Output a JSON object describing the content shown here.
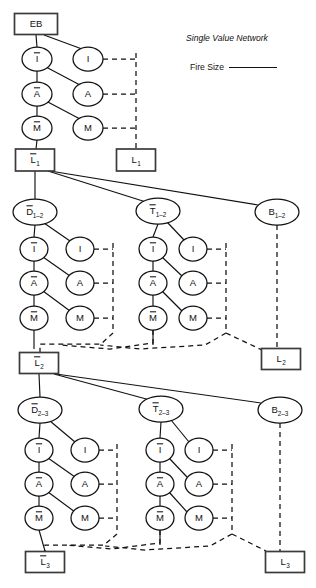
{
  "figure": {
    "type": "influence-diagram",
    "background": "#ffffff",
    "line_color": "#111111",
    "box_stroke": "#3b3b3b"
  },
  "legend": {
    "title": "Single Value Network",
    "entries": [
      {
        "label": "Fire Size",
        "style": "solid-line"
      }
    ]
  },
  "nodes": [
    {
      "id": "EB",
      "label": "EB",
      "shape": "rect",
      "overbar": false,
      "sub": "",
      "cx": 36,
      "cy": 24,
      "w": 43,
      "h": 21
    },
    {
      "id": "I0b",
      "label": "I",
      "shape": "ellipse",
      "overbar": true,
      "sub": "",
      "cx": 37,
      "cy": 59,
      "rx": 15,
      "ry": 12
    },
    {
      "id": "I0",
      "label": "I",
      "shape": "ellipse",
      "overbar": false,
      "sub": "",
      "cx": 88,
      "cy": 59,
      "rx": 15,
      "ry": 12
    },
    {
      "id": "A0b",
      "label": "A",
      "shape": "ellipse",
      "overbar": true,
      "sub": "",
      "cx": 37,
      "cy": 94,
      "rx": 15,
      "ry": 12
    },
    {
      "id": "A0",
      "label": "A",
      "shape": "ellipse",
      "overbar": false,
      "sub": "",
      "cx": 88,
      "cy": 94,
      "rx": 15,
      "ry": 12
    },
    {
      "id": "M0b",
      "label": "M",
      "shape": "ellipse",
      "overbar": true,
      "sub": "",
      "cx": 37,
      "cy": 128,
      "rx": 15,
      "ry": 12
    },
    {
      "id": "M0",
      "label": "M",
      "shape": "ellipse",
      "overbar": false,
      "sub": "",
      "cx": 88,
      "cy": 128,
      "rx": 15,
      "ry": 12
    },
    {
      "id": "L1b",
      "label": "L",
      "shape": "rect",
      "overbar": true,
      "sub": "1",
      "cx": 35,
      "cy": 160,
      "w": 39,
      "h": 22
    },
    {
      "id": "L1",
      "label": "L",
      "shape": "rect",
      "overbar": false,
      "sub": "1",
      "cx": 136,
      "cy": 160,
      "w": 39,
      "h": 22
    },
    {
      "id": "D12",
      "label": "D",
      "shape": "ellipse",
      "overbar": true,
      "sub": "1–2",
      "cx": 35,
      "cy": 212,
      "rx": 22,
      "ry": 13
    },
    {
      "id": "T12",
      "label": "T",
      "shape": "ellipse",
      "overbar": true,
      "sub": "1–2",
      "cx": 158,
      "cy": 211,
      "rx": 22,
      "ry": 13
    },
    {
      "id": "B12",
      "label": "B",
      "shape": "ellipse",
      "overbar": false,
      "sub": "1–2",
      "cx": 277,
      "cy": 212,
      "rx": 22,
      "ry": 13
    },
    {
      "id": "I1Lb",
      "label": "I",
      "shape": "ellipse",
      "overbar": true,
      "sub": "",
      "cx": 34,
      "cy": 249,
      "rx": 14,
      "ry": 12
    },
    {
      "id": "I1L",
      "label": "I",
      "shape": "ellipse",
      "overbar": false,
      "sub": "",
      "cx": 80,
      "cy": 249,
      "rx": 14,
      "ry": 12
    },
    {
      "id": "A1Lb",
      "label": "A",
      "shape": "ellipse",
      "overbar": true,
      "sub": "",
      "cx": 34,
      "cy": 283,
      "rx": 14,
      "ry": 12
    },
    {
      "id": "A1L",
      "label": "A",
      "shape": "ellipse",
      "overbar": false,
      "sub": "",
      "cx": 80,
      "cy": 283,
      "rx": 14,
      "ry": 12
    },
    {
      "id": "M1Lb",
      "label": "M",
      "shape": "ellipse",
      "overbar": true,
      "sub": "",
      "cx": 34,
      "cy": 318,
      "rx": 14,
      "ry": 12
    },
    {
      "id": "M1L",
      "label": "M",
      "shape": "ellipse",
      "overbar": false,
      "sub": "",
      "cx": 80,
      "cy": 318,
      "rx": 14,
      "ry": 12
    },
    {
      "id": "I1Rb",
      "label": "I",
      "shape": "ellipse",
      "overbar": true,
      "sub": "",
      "cx": 153,
      "cy": 249,
      "rx": 14,
      "ry": 12
    },
    {
      "id": "I1R",
      "label": "I",
      "shape": "ellipse",
      "overbar": false,
      "sub": "",
      "cx": 193,
      "cy": 249,
      "rx": 14,
      "ry": 12
    },
    {
      "id": "A1Rb",
      "label": "A",
      "shape": "ellipse",
      "overbar": true,
      "sub": "",
      "cx": 153,
      "cy": 283,
      "rx": 14,
      "ry": 12
    },
    {
      "id": "A1R",
      "label": "A",
      "shape": "ellipse",
      "overbar": false,
      "sub": "",
      "cx": 193,
      "cy": 283,
      "rx": 14,
      "ry": 12
    },
    {
      "id": "M1Rb",
      "label": "M",
      "shape": "ellipse",
      "overbar": true,
      "sub": "",
      "cx": 153,
      "cy": 318,
      "rx": 14,
      "ry": 12
    },
    {
      "id": "M1R",
      "label": "M",
      "shape": "ellipse",
      "overbar": false,
      "sub": "",
      "cx": 193,
      "cy": 318,
      "rx": 14,
      "ry": 12
    },
    {
      "id": "L2b",
      "label": "L",
      "shape": "rect",
      "overbar": true,
      "sub": "2",
      "cx": 39,
      "cy": 363,
      "w": 39,
      "h": 21
    },
    {
      "id": "L2",
      "label": "L",
      "shape": "rect",
      "overbar": false,
      "sub": "2",
      "cx": 281,
      "cy": 359,
      "w": 39,
      "h": 21
    },
    {
      "id": "D23",
      "label": "D",
      "shape": "ellipse",
      "overbar": true,
      "sub": "2–3",
      "cx": 40,
      "cy": 410,
      "rx": 22,
      "ry": 13
    },
    {
      "id": "T23",
      "label": "T",
      "shape": "ellipse",
      "overbar": true,
      "sub": "2–3",
      "cx": 161,
      "cy": 409,
      "rx": 22,
      "ry": 13
    },
    {
      "id": "B23",
      "label": "B",
      "shape": "ellipse",
      "overbar": false,
      "sub": "2–3",
      "cx": 280,
      "cy": 410,
      "rx": 22,
      "ry": 13
    },
    {
      "id": "I2Lb",
      "label": "I",
      "shape": "ellipse",
      "overbar": true,
      "sub": "",
      "cx": 39,
      "cy": 450,
      "rx": 14,
      "ry": 12
    },
    {
      "id": "I2L",
      "label": "I",
      "shape": "ellipse",
      "overbar": false,
      "sub": "",
      "cx": 85,
      "cy": 450,
      "rx": 14,
      "ry": 12
    },
    {
      "id": "A2Lb",
      "label": "A",
      "shape": "ellipse",
      "overbar": true,
      "sub": "",
      "cx": 39,
      "cy": 484,
      "rx": 14,
      "ry": 12
    },
    {
      "id": "A2L",
      "label": "A",
      "shape": "ellipse",
      "overbar": false,
      "sub": "",
      "cx": 85,
      "cy": 484,
      "rx": 14,
      "ry": 12
    },
    {
      "id": "M2Lb",
      "label": "M",
      "shape": "ellipse",
      "overbar": true,
      "sub": "",
      "cx": 39,
      "cy": 518,
      "rx": 14,
      "ry": 12
    },
    {
      "id": "M2L",
      "label": "M",
      "shape": "ellipse",
      "overbar": false,
      "sub": "",
      "cx": 85,
      "cy": 518,
      "rx": 14,
      "ry": 12
    },
    {
      "id": "I2Rb",
      "label": "I",
      "shape": "ellipse",
      "overbar": true,
      "sub": "",
      "cx": 160,
      "cy": 450,
      "rx": 14,
      "ry": 12
    },
    {
      "id": "I2R",
      "label": "I",
      "shape": "ellipse",
      "overbar": false,
      "sub": "",
      "cx": 199,
      "cy": 450,
      "rx": 14,
      "ry": 12
    },
    {
      "id": "A2Rb",
      "label": "A",
      "shape": "ellipse",
      "overbar": true,
      "sub": "",
      "cx": 160,
      "cy": 484,
      "rx": 14,
      "ry": 12
    },
    {
      "id": "A2R",
      "label": "A",
      "shape": "ellipse",
      "overbar": false,
      "sub": "",
      "cx": 199,
      "cy": 484,
      "rx": 14,
      "ry": 12
    },
    {
      "id": "M2Rb",
      "label": "M",
      "shape": "ellipse",
      "overbar": true,
      "sub": "",
      "cx": 160,
      "cy": 518,
      "rx": 14,
      "ry": 12
    },
    {
      "id": "M2R",
      "label": "M",
      "shape": "ellipse",
      "overbar": false,
      "sub": "",
      "cx": 199,
      "cy": 518,
      "rx": 14,
      "ry": 12
    },
    {
      "id": "L3b",
      "label": "L",
      "shape": "rect",
      "overbar": true,
      "sub": "3",
      "cx": 45,
      "cy": 562,
      "w": 39,
      "h": 21
    },
    {
      "id": "L3",
      "label": "L",
      "shape": "rect",
      "overbar": false,
      "sub": "3",
      "cx": 285,
      "cy": 562,
      "w": 39,
      "h": 21
    }
  ],
  "edges": {
    "solid": [
      "M36,35 L37,47",
      "M44,35 L82,49",
      "M37,71 L37,82",
      "M46,67 L80,85",
      "M37,106 L37,116",
      "M46,101 L80,119",
      "M37,140 L36,149",
      "M35,171 L35,199",
      "M48,171 L146,202",
      "M50,171 L258,205",
      "M35,225 L34,237",
      "M44,223 L70,241",
      "M34,261 L34,271",
      "M43,257 L70,276",
      "M34,295 L34,306",
      "M43,291 L70,311",
      "M34,330 L34,349",
      "M158,224 L153,237",
      "M167,222 L184,240",
      "M153,261 L153,271",
      "M162,257 L182,276",
      "M153,295 L153,306",
      "M162,291 L182,311",
      "M153,330 L153,345",
      "M39,374 L40,397",
      "M54,374 L150,400",
      "M56,374 L261,403",
      "M40,423 L39,438",
      "M50,421 L75,442",
      "M39,462 L39,472",
      "M48,458 L75,477",
      "M39,496 L39,506",
      "M48,492 L75,512",
      "M39,530 L45,551",
      "M161,422 L160,438",
      "M171,420 L189,442",
      "M160,462 L160,472",
      "M169,458 L187,477",
      "M160,496 L160,506",
      "M169,492 L187,512",
      "M160,530 L160,545"
    ],
    "dashed": [
      "M103,59 L136,59",
      "M103,94 L136,94",
      "M103,128 L136,128",
      "M136,53 L136,149",
      "M94,249 L113,249",
      "M94,283 L113,283",
      "M94,318 L113,318",
      "M113,243 L113,333 L101,344 L40,344 L40,352",
      "M207,249 L226,249",
      "M207,283 L226,283",
      "M207,318 L226,318",
      "M226,243 L226,333 L262,350",
      "M153,330 L153,343 L110,349 L60,345",
      "M226,333 L205,345 L140,349 L100,345",
      "M277,225 L277,345 L277,352",
      "M99,450 L117,450",
      "M99,484 L117,484",
      "M99,518 L117,518",
      "M117,444 L117,534 L104,545 L45,545 L45,552",
      "M213,450 L232,450",
      "M213,484 L232,484",
      "M213,518 L232,518",
      "M232,444 L232,534 L266,551",
      "M160,530 L160,543 L112,549 L66,545",
      "M232,534 L210,546 L145,550 L105,546",
      "M280,423 L280,545 L280,552"
    ]
  }
}
